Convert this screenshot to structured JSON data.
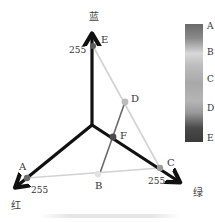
{
  "diagram": {
    "type": "rgb-color-cube-axes",
    "axes": {
      "blue": {
        "label": "蓝",
        "max_label": "255",
        "color": "#111111"
      },
      "red": {
        "label": "红",
        "max_label": "255",
        "color": "#111111"
      },
      "green": {
        "label": "绿",
        "max_label": "255",
        "color": "#111111"
      }
    },
    "points": {
      "A": {
        "label": "A",
        "on_axis": "red",
        "color": "#6b6b6b"
      },
      "B": {
        "label": "B",
        "color": "#e0e0e0"
      },
      "C": {
        "label": "C",
        "on_axis": "green",
        "color": "#9a9a9a"
      },
      "D": {
        "label": "D",
        "color": "#b8b8b8"
      },
      "E": {
        "label": "E",
        "on_axis": "blue",
        "color": "#5a5a5a"
      },
      "F": {
        "label": "F",
        "color": "#4a4a4a"
      }
    },
    "edges": [
      {
        "from": "A",
        "to": "C",
        "color": "#cfcfcf"
      },
      {
        "from": "E",
        "to": "C",
        "color": "#cfcfcf"
      },
      {
        "from": "B",
        "to": "D",
        "color": "#6a6a6a"
      }
    ],
    "colorbar": {
      "labels": [
        "A",
        "B",
        "C",
        "D",
        "E"
      ]
    }
  }
}
